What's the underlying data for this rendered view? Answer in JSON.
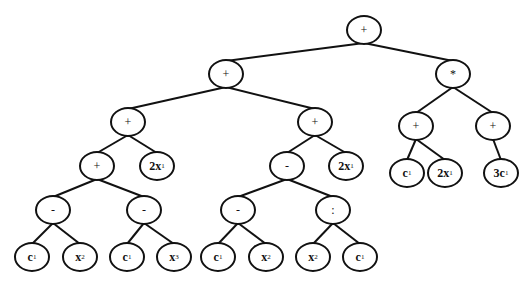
{
  "diagram": {
    "type": "expression-tree",
    "edge_color": "#111111",
    "node_border_color": "#111111",
    "background": "#ffffff",
    "nodes": [
      {
        "id": "n0",
        "label": "+",
        "base": "+",
        "sub": "",
        "kind": "op",
        "x": 364,
        "y": 30,
        "w": 36,
        "h": 30
      },
      {
        "id": "n1",
        "label": "+",
        "base": "+",
        "sub": "",
        "kind": "op",
        "x": 226,
        "y": 74,
        "w": 36,
        "h": 30
      },
      {
        "id": "n2",
        "label": "*",
        "base": "*",
        "sub": "",
        "kind": "op",
        "x": 453,
        "y": 74,
        "w": 36,
        "h": 30
      },
      {
        "id": "n3",
        "label": "+",
        "base": "+",
        "sub": "",
        "kind": "op",
        "x": 128,
        "y": 122,
        "w": 36,
        "h": 30
      },
      {
        "id": "n4",
        "label": "+",
        "base": "+",
        "sub": "",
        "kind": "op",
        "x": 315,
        "y": 122,
        "w": 36,
        "h": 30
      },
      {
        "id": "n5",
        "label": "+",
        "base": "+",
        "sub": "",
        "kind": "op",
        "x": 416,
        "y": 126,
        "w": 36,
        "h": 30
      },
      {
        "id": "n6",
        "label": "+",
        "base": "+",
        "sub": "",
        "kind": "op",
        "x": 493,
        "y": 126,
        "w": 36,
        "h": 30
      },
      {
        "id": "n7",
        "label": "+",
        "base": "+",
        "sub": "",
        "kind": "op",
        "x": 97,
        "y": 166,
        "w": 36,
        "h": 30
      },
      {
        "id": "n8",
        "label": "2x1",
        "base": "2x",
        "sub": "1",
        "kind": "leaf",
        "x": 157,
        "y": 166,
        "w": 36,
        "h": 30
      },
      {
        "id": "n9",
        "label": "-",
        "base": "-",
        "sub": "",
        "kind": "op",
        "x": 287,
        "y": 166,
        "w": 36,
        "h": 30
      },
      {
        "id": "n10",
        "label": "2x1",
        "base": "2x",
        "sub": "1",
        "kind": "leaf",
        "x": 346,
        "y": 166,
        "w": 36,
        "h": 30
      },
      {
        "id": "n11",
        "label": "c1",
        "base": "c",
        "sub": "1",
        "kind": "leaf",
        "x": 407,
        "y": 173,
        "w": 36,
        "h": 30
      },
      {
        "id": "n12",
        "label": "2x1",
        "base": "2x",
        "sub": "1",
        "kind": "leaf",
        "x": 445,
        "y": 173,
        "w": 36,
        "h": 30
      },
      {
        "id": "n13",
        "label": "3c1",
        "base": "3c",
        "sub": "1",
        "kind": "leaf",
        "x": 501,
        "y": 173,
        "w": 36,
        "h": 30
      },
      {
        "id": "n14",
        "label": "-",
        "base": "-",
        "sub": "",
        "kind": "op",
        "x": 53,
        "y": 210,
        "w": 36,
        "h": 30
      },
      {
        "id": "n15",
        "label": "-",
        "base": "-",
        "sub": "",
        "kind": "op",
        "x": 144,
        "y": 210,
        "w": 36,
        "h": 30
      },
      {
        "id": "n16",
        "label": "-",
        "base": "-",
        "sub": "",
        "kind": "op",
        "x": 238,
        "y": 210,
        "w": 36,
        "h": 30
      },
      {
        "id": "n17",
        "label": ":",
        "base": ":",
        "sub": "",
        "kind": "op",
        "x": 333,
        "y": 210,
        "w": 36,
        "h": 30
      },
      {
        "id": "n18",
        "label": "c1",
        "base": "c",
        "sub": "1",
        "kind": "leaf",
        "x": 32,
        "y": 257,
        "w": 36,
        "h": 30
      },
      {
        "id": "n19",
        "label": "x2",
        "base": "x",
        "sub": "2",
        "kind": "leaf",
        "x": 80,
        "y": 257,
        "w": 36,
        "h": 30
      },
      {
        "id": "n20",
        "label": "c1",
        "base": "c",
        "sub": "1",
        "kind": "leaf",
        "x": 127,
        "y": 257,
        "w": 36,
        "h": 30
      },
      {
        "id": "n21",
        "label": "x3",
        "base": "x",
        "sub": "3",
        "kind": "leaf",
        "x": 174,
        "y": 257,
        "w": 36,
        "h": 30
      },
      {
        "id": "n22",
        "label": "c1",
        "base": "c",
        "sub": "1",
        "kind": "leaf",
        "x": 218,
        "y": 257,
        "w": 36,
        "h": 30
      },
      {
        "id": "n23",
        "label": "x2",
        "base": "x",
        "sub": "2",
        "kind": "leaf",
        "x": 266,
        "y": 257,
        "w": 36,
        "h": 30
      },
      {
        "id": "n24",
        "label": "x2",
        "base": "x",
        "sub": "2",
        "kind": "leaf",
        "x": 313,
        "y": 257,
        "w": 36,
        "h": 30
      },
      {
        "id": "n25",
        "label": "c1",
        "base": "c",
        "sub": "1",
        "kind": "leaf",
        "x": 360,
        "y": 257,
        "w": 36,
        "h": 30
      }
    ],
    "edges": [
      [
        "n0",
        "n1"
      ],
      [
        "n0",
        "n2"
      ],
      [
        "n1",
        "n3"
      ],
      [
        "n1",
        "n4"
      ],
      [
        "n2",
        "n5"
      ],
      [
        "n2",
        "n6"
      ],
      [
        "n3",
        "n7"
      ],
      [
        "n3",
        "n8"
      ],
      [
        "n4",
        "n9"
      ],
      [
        "n4",
        "n10"
      ],
      [
        "n5",
        "n11"
      ],
      [
        "n5",
        "n12"
      ],
      [
        "n6",
        "n13"
      ],
      [
        "n7",
        "n14"
      ],
      [
        "n7",
        "n15"
      ],
      [
        "n9",
        "n16"
      ],
      [
        "n9",
        "n17"
      ],
      [
        "n14",
        "n18"
      ],
      [
        "n14",
        "n19"
      ],
      [
        "n15",
        "n20"
      ],
      [
        "n15",
        "n21"
      ],
      [
        "n16",
        "n22"
      ],
      [
        "n16",
        "n23"
      ],
      [
        "n17",
        "n24"
      ],
      [
        "n17",
        "n25"
      ]
    ]
  }
}
